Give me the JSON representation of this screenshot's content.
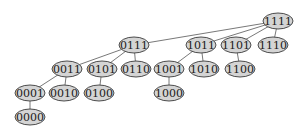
{
  "diagram": {
    "type": "tree",
    "colors": {
      "node_fill": "#d4d4d4",
      "node_stroke": "#3a3a3a",
      "edge": "#555555",
      "background": "#ffffff"
    },
    "node_size": {
      "rx": 15,
      "ry": 8
    },
    "nodes": [
      {
        "id": "1111",
        "label": "1111",
        "x": 278,
        "y": 21
      },
      {
        "id": "0111",
        "label": "0111",
        "x": 134,
        "y": 45
      },
      {
        "id": "1011",
        "label": "1011",
        "x": 201,
        "y": 45
      },
      {
        "id": "1101",
        "label": "1101",
        "x": 236,
        "y": 45
      },
      {
        "id": "1110",
        "label": "1110",
        "x": 273,
        "y": 45
      },
      {
        "id": "0011",
        "label": "0011",
        "x": 67,
        "y": 69
      },
      {
        "id": "0101",
        "label": "0101",
        "x": 102,
        "y": 69
      },
      {
        "id": "0110",
        "label": "0110",
        "x": 136,
        "y": 69
      },
      {
        "id": "1001",
        "label": "1001",
        "x": 169,
        "y": 69
      },
      {
        "id": "1010",
        "label": "1010",
        "x": 204,
        "y": 69
      },
      {
        "id": "1100",
        "label": "1100",
        "x": 240,
        "y": 69
      },
      {
        "id": "0001",
        "label": "0001",
        "x": 30,
        "y": 93
      },
      {
        "id": "0010",
        "label": "0010",
        "x": 64,
        "y": 93
      },
      {
        "id": "0100",
        "label": "0100",
        "x": 99,
        "y": 93
      },
      {
        "id": "1000",
        "label": "1000",
        "x": 169,
        "y": 93
      },
      {
        "id": "0000",
        "label": "0000",
        "x": 30,
        "y": 117
      }
    ],
    "edges": [
      [
        "1111",
        "0111"
      ],
      [
        "1111",
        "1011"
      ],
      [
        "1111",
        "1101"
      ],
      [
        "1111",
        "1110"
      ],
      [
        "0111",
        "0011"
      ],
      [
        "0111",
        "0101"
      ],
      [
        "0111",
        "0110"
      ],
      [
        "1011",
        "1001"
      ],
      [
        "1011",
        "1010"
      ],
      [
        "1101",
        "1100"
      ],
      [
        "0011",
        "0001"
      ],
      [
        "0011",
        "0010"
      ],
      [
        "0101",
        "0100"
      ],
      [
        "1001",
        "1000"
      ],
      [
        "0001",
        "0000"
      ]
    ]
  }
}
